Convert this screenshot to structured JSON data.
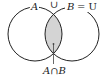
{
  "diagram": {
    "colors": {
      "stroke": "#222222",
      "intersection_fill": "#d4d4d4",
      "background": "#ffffff"
    },
    "sets": [
      {
        "name": "A",
        "label": "A",
        "cx": 35,
        "cy": 34,
        "r": 27
      },
      {
        "name": "B",
        "label": "B",
        "cx": 72,
        "cy": 34,
        "r": 27
      }
    ],
    "top_labels": {
      "a": "A",
      "union": "∪",
      "b": "B",
      "equals_u": "= U"
    },
    "intersection_label": "A∩B"
  }
}
